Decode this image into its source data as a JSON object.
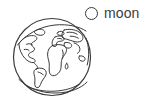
{
  "figure": {
    "background_color": "#ffffff",
    "line_color": "#3a3a3a",
    "stroke_width": 1.1
  },
  "globe": {
    "name": "earth-globe",
    "center_x": 52,
    "center_y": 57,
    "radius": 39,
    "fill": "none",
    "outline_color": "#3a3a3a",
    "landmasses": [
      "north-america",
      "south-america",
      "greenland",
      "europe",
      "africa",
      "asia",
      "antarctica-rim"
    ]
  },
  "legend": {
    "name": "moon-legend",
    "marker": {
      "icon": "circle-outline-icon",
      "diameter": 13,
      "center_x": 92,
      "center_y": 13,
      "fill": "none",
      "stroke": "#3a3a3a"
    },
    "label": "moon",
    "label_color": "#3c3c3c",
    "label_size_px": 14
  }
}
